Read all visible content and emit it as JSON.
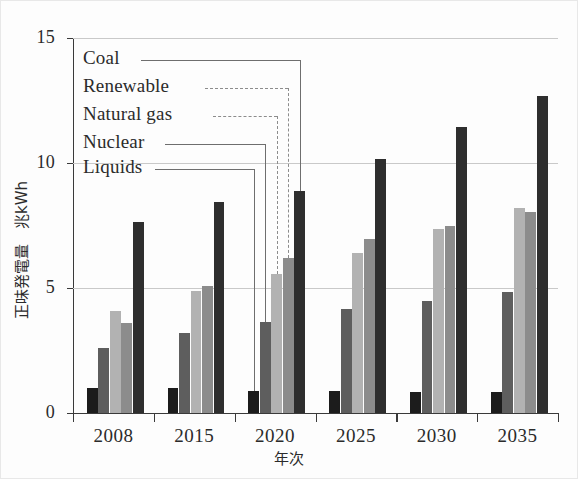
{
  "chart_data": {
    "type": "bar",
    "title": "",
    "xlabel": "年次",
    "ylabel": "正味発電量　兆kWh",
    "categories": [
      "2008",
      "2015",
      "2020",
      "2025",
      "2030",
      "2035"
    ],
    "ylim": [
      0,
      15
    ],
    "yticks": [
      0,
      5,
      10,
      15
    ],
    "ytick_labels": [
      "0",
      "5",
      "10",
      "15"
    ],
    "grid": true,
    "legend_position": "inside-upper-left-callouts",
    "series": [
      {
        "name": "Liquids",
        "color": "#1c1c1c",
        "values": [
          1.0,
          1.0,
          0.9,
          0.9,
          0.85,
          0.85
        ]
      },
      {
        "name": "Nuclear",
        "color": "#5e5e5e",
        "values": [
          2.6,
          3.2,
          3.65,
          4.15,
          4.5,
          4.85
        ]
      },
      {
        "name": "Natural gas",
        "color": "#b2b2b2",
        "values": [
          4.1,
          4.9,
          5.55,
          6.4,
          7.35,
          8.2
        ]
      },
      {
        "name": "Renewable",
        "color": "#8c8c8c",
        "values": [
          3.6,
          5.1,
          6.2,
          6.95,
          7.5,
          8.05
        ]
      },
      {
        "name": "Coal",
        "color": "#2e2e2e",
        "values": [
          7.65,
          8.45,
          8.9,
          10.15,
          11.45,
          12.7
        ]
      }
    ]
  },
  "callouts": [
    {
      "label": "Coal",
      "series": "Coal"
    },
    {
      "label": "Renewable",
      "series": "Renewable"
    },
    {
      "label": "Natural gas",
      "series": "Natural gas"
    },
    {
      "label": "Nuclear",
      "series": "Nuclear"
    },
    {
      "label": "Liquids",
      "series": "Liquids"
    }
  ]
}
